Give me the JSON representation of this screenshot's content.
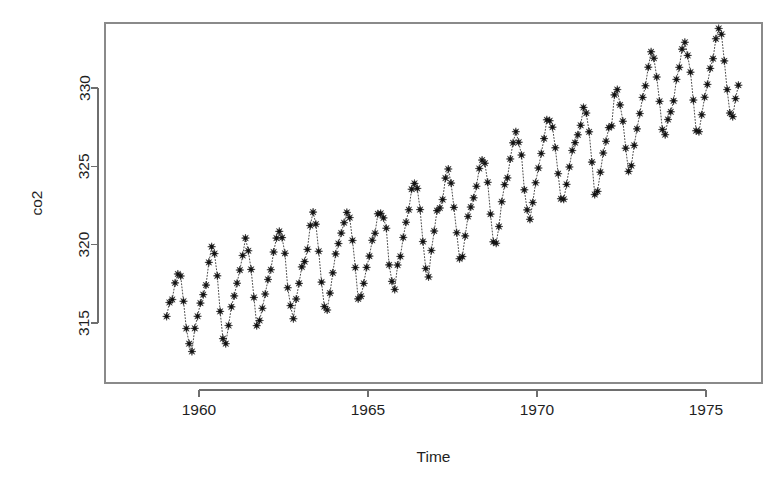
{
  "chart_data": {
    "type": "scatter",
    "title": "",
    "subtitle": "",
    "xlabel": "Time",
    "ylabel": "co2",
    "xlim": [
      1958.9,
      1976.1
    ],
    "ylim": [
      312.4,
      334.2
    ],
    "grid": false,
    "legend": null,
    "marker": "star",
    "line_style": "dotted",
    "xticks": [
      1960,
      1965,
      1970,
      1975
    ],
    "xtick_labels": [
      "1960",
      "1965",
      "1970",
      "1975"
    ],
    "yticks": [
      315,
      320,
      325,
      330
    ],
    "ytick_labels": [
      "315",
      "320",
      "325",
      "330"
    ],
    "series_name": "co2",
    "x_unit": "year (monthly observations)",
    "y_unit": "ppm",
    "x": [
      1959.0417,
      1959.125,
      1959.2083,
      1959.2917,
      1959.375,
      1959.4583,
      1959.5417,
      1959.625,
      1959.7083,
      1959.7917,
      1959.875,
      1959.9583,
      1960.0417,
      1960.125,
      1960.2083,
      1960.2917,
      1960.375,
      1960.4583,
      1960.5417,
      1960.625,
      1960.7083,
      1960.7917,
      1960.875,
      1960.9583,
      1961.0417,
      1961.125,
      1961.2083,
      1961.2917,
      1961.375,
      1961.4583,
      1961.5417,
      1961.625,
      1961.7083,
      1961.7917,
      1961.875,
      1961.9583,
      1962.0417,
      1962.125,
      1962.2083,
      1962.2917,
      1962.375,
      1962.4583,
      1962.5417,
      1962.625,
      1962.7083,
      1962.7917,
      1962.875,
      1962.9583,
      1963.0417,
      1963.125,
      1963.2083,
      1963.2917,
      1963.375,
      1963.4583,
      1963.5417,
      1963.625,
      1963.7083,
      1963.7917,
      1963.875,
      1963.9583,
      1964.0417,
      1964.125,
      1964.2083,
      1964.2917,
      1964.375,
      1964.4583,
      1964.5417,
      1964.625,
      1964.7083,
      1964.7917,
      1964.875,
      1964.9583,
      1965.0417,
      1965.125,
      1965.2083,
      1965.2917,
      1965.375,
      1965.4583,
      1965.5417,
      1965.625,
      1965.7083,
      1965.7917,
      1965.875,
      1965.9583,
      1966.0417,
      1966.125,
      1966.2083,
      1966.2917,
      1966.375,
      1966.4583,
      1966.5417,
      1966.625,
      1966.7083,
      1966.7917,
      1966.875,
      1966.9583,
      1967.0417,
      1967.125,
      1967.2083,
      1967.2917,
      1967.375,
      1967.4583,
      1967.5417,
      1967.625,
      1967.7083,
      1967.7917,
      1967.875,
      1967.9583,
      1968.0417,
      1968.125,
      1968.2083,
      1968.2917,
      1968.375,
      1968.4583,
      1968.5417,
      1968.625,
      1968.7083,
      1968.7917,
      1968.875,
      1968.9583,
      1969.0417,
      1969.125,
      1969.2083,
      1969.2917,
      1969.375,
      1969.4583,
      1969.5417,
      1969.625,
      1969.7083,
      1969.7917,
      1969.875,
      1969.9583,
      1970.0417,
      1970.125,
      1970.2083,
      1970.2917,
      1970.375,
      1970.4583,
      1970.5417,
      1970.625,
      1970.7083,
      1970.7917,
      1970.875,
      1970.9583,
      1971.0417,
      1971.125,
      1971.2083,
      1971.2917,
      1971.375,
      1971.4583,
      1971.5417,
      1971.625,
      1971.7083,
      1971.7917,
      1971.875,
      1971.9583,
      1972.0417,
      1972.125,
      1972.2083,
      1972.2917,
      1972.375,
      1972.4583,
      1972.5417,
      1972.625,
      1972.7083,
      1972.7917,
      1972.875,
      1972.9583,
      1973.0417,
      1973.125,
      1973.2083,
      1973.2917,
      1973.375,
      1973.4583,
      1973.5417,
      1973.625,
      1973.7083,
      1973.7917,
      1973.875,
      1973.9583,
      1974.0417,
      1974.125,
      1974.2083,
      1974.2917,
      1974.375,
      1974.4583,
      1974.5417,
      1974.625,
      1974.7083,
      1974.7917,
      1974.875,
      1974.9583,
      1975.0417,
      1975.125,
      1975.2083,
      1975.2917,
      1975.375,
      1975.4583,
      1975.5417,
      1975.625,
      1975.7083,
      1975.7917,
      1975.875,
      1975.9583
    ],
    "values": [
      315.42,
      316.31,
      316.5,
      317.56,
      318.13,
      318.0,
      316.39,
      314.65,
      313.68,
      313.18,
      314.66,
      315.43,
      316.27,
      316.81,
      317.42,
      318.87,
      319.87,
      319.43,
      318.01,
      315.74,
      314.0,
      313.68,
      314.84,
      316.03,
      316.73,
      317.54,
      318.38,
      319.31,
      320.42,
      319.61,
      318.42,
      316.63,
      314.83,
      315.16,
      315.94,
      316.85,
      317.78,
      318.4,
      319.53,
      320.42,
      320.85,
      320.45,
      319.45,
      317.25,
      316.11,
      315.27,
      316.53,
      317.53,
      318.58,
      318.92,
      319.7,
      321.22,
      322.08,
      321.31,
      319.58,
      317.61,
      316.05,
      315.83,
      316.91,
      318.2,
      319.41,
      320.07,
      320.74,
      321.4,
      322.06,
      321.73,
      320.27,
      318.54,
      316.54,
      316.71,
      317.53,
      318.55,
      319.27,
      320.28,
      320.73,
      321.97,
      322.0,
      321.71,
      321.05,
      318.71,
      317.66,
      317.14,
      318.7,
      319.25,
      320.46,
      321.43,
      322.23,
      323.54,
      323.91,
      323.59,
      322.24,
      320.2,
      318.48,
      317.94,
      319.63,
      320.87,
      322.17,
      322.34,
      322.88,
      324.25,
      324.83,
      323.93,
      322.38,
      320.76,
      319.1,
      319.24,
      320.56,
      321.8,
      322.4,
      322.99,
      323.73,
      324.86,
      325.4,
      325.2,
      323.98,
      321.95,
      320.18,
      320.09,
      321.16,
      322.74,
      323.83,
      324.26,
      325.47,
      326.5,
      327.21,
      326.54,
      325.72,
      323.5,
      322.22,
      321.62,
      322.69,
      323.95,
      324.89,
      325.82,
      326.77,
      327.97,
      327.91,
      327.5,
      326.18,
      324.53,
      322.93,
      322.9,
      323.85,
      324.96,
      326.01,
      326.51,
      327.01,
      327.62,
      328.76,
      328.4,
      327.2,
      325.27,
      323.2,
      323.4,
      324.63,
      325.85,
      326.6,
      327.47,
      327.58,
      329.56,
      329.9,
      328.92,
      327.88,
      326.16,
      324.68,
      325.04,
      326.34,
      327.39,
      328.37,
      329.4,
      330.14,
      331.33,
      332.31,
      331.9,
      330.7,
      329.15,
      327.35,
      327.02,
      327.99,
      328.48,
      329.18,
      330.55,
      331.32,
      332.48,
      332.92,
      332.08,
      331.01,
      329.23,
      327.27,
      327.21,
      328.29,
      329.41,
      330.23,
      331.25,
      331.87,
      333.14,
      333.8,
      333.43,
      331.73,
      329.9,
      328.4,
      328.17,
      329.32,
      330.18
    ]
  },
  "geometry": {
    "plot_left": 105,
    "plot_right": 762,
    "plot_top": 23,
    "plot_bottom": 383,
    "x_at_1960": 199,
    "px_per_year": 33.8,
    "y_at_330": 88,
    "px_per_ppm": 15.667
  },
  "axis": {
    "x_title": "Time",
    "y_title": "co2"
  }
}
